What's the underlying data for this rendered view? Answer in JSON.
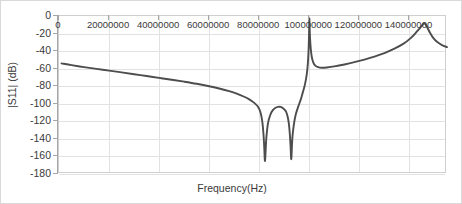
{
  "chart_data": {
    "type": "line",
    "title": "",
    "xlabel": "Frequency(Hz)",
    "ylabel": "|S11| (dB)",
    "xlim": [
      0,
      155000000
    ],
    "ylim": [
      -180,
      0
    ],
    "grid": true,
    "legend": "none",
    "xticks": [
      0,
      20000000,
      40000000,
      60000000,
      80000000,
      100000000,
      120000000,
      140000000
    ],
    "xticklabels": [
      "0",
      "20000000",
      "40000000",
      "60000000",
      "80000000",
      "100000000",
      "120000000",
      "140000000"
    ],
    "yticks": [
      0,
      -20,
      -40,
      -60,
      -80,
      -100,
      -120,
      -140,
      -160,
      -180
    ],
    "yticklabels": [
      "0",
      "-20",
      "-40",
      "-60",
      "-80",
      "-100",
      "-120",
      "-140",
      "-160",
      "-180"
    ],
    "series": [
      {
        "name": "|S11|",
        "color": "#4d4d4d",
        "x": [
          1000000,
          5000000,
          10000000,
          15000000,
          20000000,
          25000000,
          30000000,
          35000000,
          40000000,
          45000000,
          50000000,
          55000000,
          60000000,
          64000000,
          68000000,
          71000000,
          74000000,
          76000000,
          78000000,
          79500000,
          80500000,
          81200000,
          81700000,
          82000000,
          82300000,
          82800000,
          83500000,
          84500000,
          85500000,
          86500000,
          87500000,
          88500000,
          89500000,
          90500000,
          91200000,
          91800000,
          92200000,
          92500000,
          92800000,
          93200000,
          93800000,
          94600000,
          95600000,
          96600000,
          97400000,
          98000000,
          98600000,
          99000000,
          99300000,
          99550000,
          99750000,
          99900000,
          100000000,
          100100000,
          100300000,
          100600000,
          101000000,
          101600000,
          102400000,
          103500000,
          105000000,
          107000000,
          110000000,
          114000000,
          118000000,
          122000000,
          126000000,
          130000000,
          134000000,
          137500000,
          140500000,
          143000000,
          144800000,
          145800000,
          146500000,
          147200000,
          148200000,
          149500000,
          151000000,
          153000000,
          155000000
        ],
        "y": [
          -54.0,
          -56.0,
          -58.2,
          -60.2,
          -62.2,
          -64.2,
          -66.3,
          -68.4,
          -70.5,
          -72.6,
          -74.8,
          -77.2,
          -80.0,
          -82.6,
          -85.6,
          -88.4,
          -92.0,
          -95.0,
          -99.0,
          -103.5,
          -110.0,
          -120.0,
          -135.0,
          -150.0,
          -165.0,
          -140.0,
          -122.0,
          -112.0,
          -107.0,
          -104.5,
          -103.5,
          -103.5,
          -105.0,
          -108.0,
          -113.0,
          -122.0,
          -134.0,
          -148.0,
          -163.0,
          -140.0,
          -124.0,
          -112.0,
          -103.0,
          -95.0,
          -87.0,
          -81.0,
          -73.0,
          -66.0,
          -58.0,
          -48.0,
          -35.0,
          -18.0,
          -3.0,
          -10.0,
          -26.0,
          -38.0,
          -47.0,
          -53.0,
          -56.5,
          -58.3,
          -59.0,
          -58.6,
          -57.4,
          -55.2,
          -52.6,
          -49.6,
          -46.2,
          -42.2,
          -37.2,
          -31.8,
          -25.2,
          -17.6,
          -11.6,
          -8.4,
          -9.8,
          -13.4,
          -19.0,
          -25.0,
          -29.4,
          -33.2,
          -35.4
        ]
      }
    ]
  }
}
